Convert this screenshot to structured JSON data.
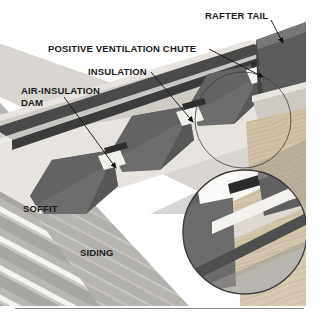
{
  "figure": {
    "kind": "technical-illustration",
    "background_color": "#ffffff",
    "rule_color": "#8a8a8a"
  },
  "labels": {
    "rafter_tail": "RAFTER TAIL",
    "positive_ventilation_chute": "POSITIVE VENTILATION CHUTE",
    "insulation": "INSULATION",
    "air_insulation_dam": "AIR-INSULATION\nDAM",
    "soffit": "SOFFIT",
    "siding": "SIDING"
  },
  "palette": {
    "sky": "#ffffff",
    "sheathing_light": "#e9e6e1",
    "sheathing_mid": "#cdc9c2",
    "fascia_dark": "#4e4e4e",
    "insulation_dark": "#6a6a6a",
    "insulation_darker": "#565656",
    "soffit_gray": "#b9b7b3",
    "siding_gray": "#a9a7a4",
    "siding_highlight": "#f2f1ef",
    "wood_tan": "#c9bca6",
    "wood_tan_light": "#ded3c0",
    "outline": "#3a3a3a",
    "leader": "#111111"
  },
  "callouts": [
    {
      "name": "rafter-tail-leader",
      "label_key": "rafter_tail"
    },
    {
      "name": "ventilation-chute-leader",
      "label_key": "positive_ventilation_chute"
    },
    {
      "name": "insulation-leader",
      "label_key": "insulation"
    },
    {
      "name": "air-insulation-dam-leader",
      "label_key": "air_insulation_dam"
    }
  ],
  "detail_inset": {
    "name": "magnified-detail-circle",
    "shape": "circle",
    "center_x": 245,
    "center_y": 232,
    "radius": 63,
    "source_circle": {
      "center_x": 243,
      "center_y": 120,
      "radius": 48
    }
  }
}
